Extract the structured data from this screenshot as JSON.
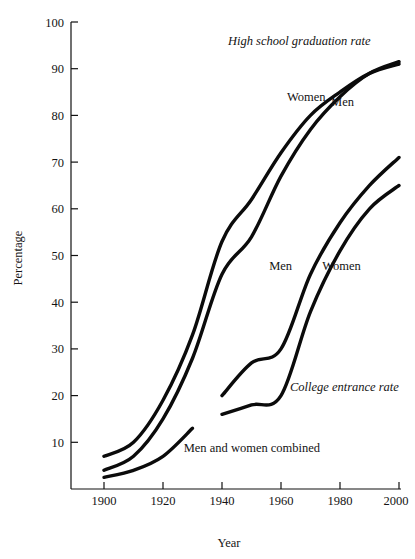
{
  "chart_data": {
    "type": "line",
    "title": "",
    "xlabel": "Year",
    "ylabel": "Percentage",
    "xlim": [
      1896,
      2003
    ],
    "ylim": [
      0,
      100
    ],
    "grid": false,
    "legend_position": "inline-annotations",
    "x_ticks": [
      1900,
      1920,
      1940,
      1960,
      1980,
      2000
    ],
    "y_ticks": [
      10,
      20,
      30,
      40,
      50,
      60,
      70,
      80,
      90,
      100
    ],
    "annotations": [
      {
        "text": "High school graduation rate",
        "style": "italic",
        "x": 1942,
        "y": 95
      },
      {
        "text": "College entrance rate",
        "style": "italic",
        "x": 1963,
        "y": 21
      },
      {
        "text": "Men and women combined",
        "style": "roman",
        "x": 1927,
        "y": 8
      },
      {
        "text": "Women",
        "style": "roman",
        "x": 1962,
        "y": 83
      },
      {
        "text": "Men",
        "style": "roman",
        "x": 1977,
        "y": 82
      },
      {
        "text": "Men",
        "style": "roman",
        "x": 1956,
        "y": 47
      },
      {
        "text": "Women",
        "style": "roman",
        "x": 1974,
        "y": 47
      }
    ],
    "series": [
      {
        "name": "High school graduation rate — Women",
        "group": "High school graduation rate",
        "label": "Women",
        "x": [
          1900,
          1910,
          1920,
          1930,
          1940,
          1950,
          1960,
          1970,
          1980,
          1990,
          2000
        ],
        "values": [
          7,
          10,
          19,
          33,
          53,
          62,
          72,
          80,
          85,
          89,
          91
        ]
      },
      {
        "name": "High school graduation rate — Men",
        "group": "High school graduation rate",
        "label": "Men",
        "x": [
          1900,
          1910,
          1920,
          1930,
          1940,
          1950,
          1960,
          1970,
          1980,
          1990,
          2000
        ],
        "values": [
          4,
          7,
          15,
          28,
          46,
          54,
          67,
          77,
          84,
          89,
          91.5
        ]
      },
      {
        "name": "College entrance rate — Men",
        "group": "College entrance rate",
        "label": "Men",
        "x": [
          1940,
          1950,
          1960,
          1970,
          1980,
          1990,
          2000
        ],
        "values": [
          20,
          27,
          30,
          46,
          57,
          65,
          71
        ]
      },
      {
        "name": "College entrance rate — Women",
        "group": "College entrance rate",
        "label": "Women",
        "x": [
          1940,
          1950,
          1960,
          1970,
          1980,
          1990,
          2000
        ],
        "values": [
          16,
          18,
          20,
          38,
          51,
          60,
          65
        ]
      },
      {
        "name": "College entrance rate — Men and women combined",
        "group": "College entrance rate",
        "label": "Men and women combined",
        "x": [
          1900,
          1910,
          1920,
          1930
        ],
        "values": [
          2.5,
          4,
          7,
          13
        ]
      }
    ]
  }
}
